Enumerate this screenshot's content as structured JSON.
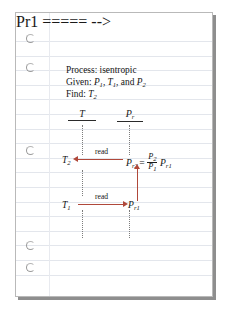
{
  "document": {
    "type": "notebook-page",
    "title": "Isentropic process relative pressure procedure",
    "holes_count": 5,
    "ruled_lines": 18
  },
  "notes": {
    "line1_label": "Process:",
    "line1_value": "isentropic",
    "line2_label": "Given:",
    "line2_v1": "P",
    "line2_v1_sub": "1",
    "line2_sep1": ", ",
    "line2_v2": "T",
    "line2_v2_sub": "1",
    "line2_sep2": ", and ",
    "line2_v3": "P",
    "line2_v3_sub": "2",
    "line3_label": "Find:",
    "line3_v1": "T",
    "line3_v1_sub": "2"
  },
  "table": {
    "col1_header": "T",
    "col2_header": "P",
    "col2_header_sub": "r"
  },
  "rows": {
    "top": {
      "temp": "T",
      "temp_sub": "2",
      "arrow_label": "read",
      "arrow_direction": "left",
      "pr_symbol": "P",
      "pr_sub": "r2",
      "equals": "=",
      "fraction_num": "P",
      "fraction_num_sub": "2",
      "fraction_den": "P",
      "fraction_den_sub": "1",
      "factor": "P",
      "factor_sub": "r1"
    },
    "bottom": {
      "temp": "T",
      "temp_sub": "1",
      "arrow_label": "read",
      "arrow_direction": "right",
      "pr_symbol": "P",
      "pr_sub": "r1"
    },
    "vertical_arrow_direction": "up"
  },
  "colors": {
    "arrow_red": "#b0483a",
    "rule_blue": "#e3e6ec",
    "text": "#141414",
    "page_border": "#b9b9b9",
    "hole_outline": "#9a9a9a"
  }
}
